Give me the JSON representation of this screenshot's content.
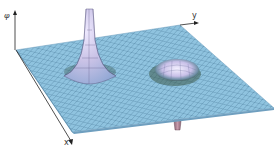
{
  "figure": {
    "type": "3d-surface-plot",
    "axes": {
      "vertical_label": "φ",
      "x_label": "x",
      "y_label": "y"
    },
    "features": [
      {
        "kind": "peak",
        "description": "tall sharp positive spike near back-left"
      },
      {
        "kind": "dip",
        "description": "shallow bump with depression ring near center-right"
      },
      {
        "kind": "negative-spike",
        "description": "thin downward spike below the surface near front-right"
      }
    ],
    "colors": {
      "surface_base": "#8fc3df",
      "surface_grid": "#4f7f9f",
      "peak_highlight": "#c9c2e6",
      "dip_shadow": "#2f4a3f",
      "spike_down": "#a57b8a",
      "axis": "#222222",
      "background": "#ffffff"
    }
  }
}
